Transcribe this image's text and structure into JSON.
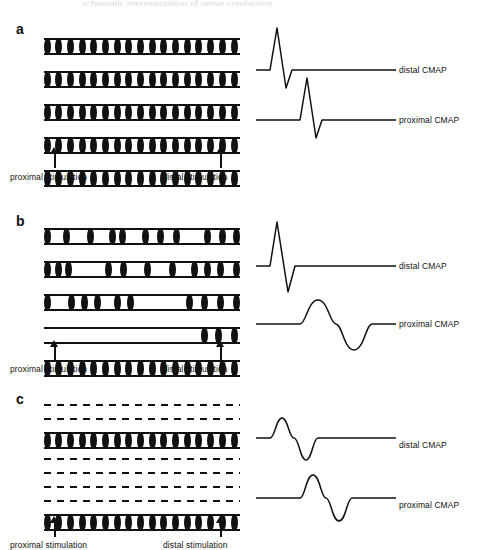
{
  "figure": {
    "top_crop_text": "schematic representation of nerve conduction",
    "ink_color": "#111111",
    "background": "#ffffff"
  },
  "labels": {
    "proximal_stimulation": "proximal stimulation",
    "distal_stimulation": "distal stimulation",
    "distal_cmap": "distal CMAP",
    "proximal_cmap": "proximal CMAP"
  },
  "panels": [
    {
      "letter": "a",
      "condition": "normal nerve",
      "fibers": [
        {
          "type": "intact",
          "myelin_segments": 17
        },
        {
          "type": "intact",
          "myelin_segments": 17
        },
        {
          "type": "intact",
          "myelin_segments": 17
        },
        {
          "type": "intact",
          "myelin_segments": 17
        },
        {
          "type": "intact",
          "myelin_segments": 17
        }
      ],
      "distal_cmap": {
        "label": "distal CMAP",
        "amplitude": "large",
        "duration": "brief",
        "shape": "sharp-biphasic"
      },
      "proximal_cmap": {
        "label": "proximal CMAP",
        "amplitude": "large",
        "duration": "brief",
        "shape": "sharp-biphasic"
      }
    },
    {
      "letter": "b",
      "condition": "segmental demyelination with conduction block and temporal dispersion",
      "fibers": [
        {
          "type": "demyelinated",
          "myelin_segments": 9
        },
        {
          "type": "demyelinated",
          "myelin_segments": 11
        },
        {
          "type": "demyelinated",
          "myelin_segments": 11
        },
        {
          "type": "blocked",
          "myelin_segments": 3
        },
        {
          "type": "intact",
          "myelin_segments": 17
        }
      ],
      "distal_cmap": {
        "label": "distal CMAP",
        "amplitude": "large",
        "duration": "brief",
        "shape": "sharp-biphasic"
      },
      "proximal_cmap": {
        "label": "proximal CMAP",
        "amplitude": "reduced",
        "duration": "prolonged",
        "shape": "dispersed-biphasic"
      }
    },
    {
      "letter": "c",
      "condition": "axonal loss",
      "fibers": [
        {
          "type": "degenerated",
          "myelin_segments": 0
        },
        {
          "type": "degenerated",
          "myelin_segments": 0
        },
        {
          "type": "intact",
          "myelin_segments": 17
        },
        {
          "type": "degenerated",
          "myelin_segments": 0
        },
        {
          "type": "degenerated",
          "myelin_segments": 0
        },
        {
          "type": "degenerated",
          "myelin_segments": 0
        },
        {
          "type": "degenerated",
          "myelin_segments": 0
        },
        {
          "type": "intact",
          "myelin_segments": 17
        }
      ],
      "distal_cmap": {
        "label": "distal CMAP",
        "amplitude": "small",
        "duration": "brief",
        "shape": "sharp-biphasic"
      },
      "proximal_cmap": {
        "label": "proximal CMAP",
        "amplitude": "small",
        "duration": "brief",
        "shape": "sharp-biphasic"
      }
    }
  ]
}
